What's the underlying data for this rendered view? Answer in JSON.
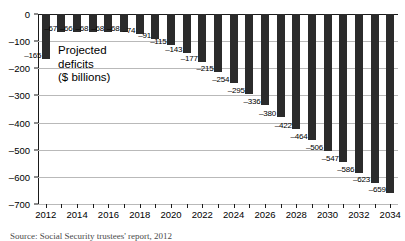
{
  "chart_data": {
    "type": "bar",
    "title": "",
    "xlabel": "",
    "ylabel": "",
    "annotation": [
      "Projected",
      "deficits",
      "($ billions)"
    ],
    "ylim": [
      -700,
      0
    ],
    "ytick_values": [
      0,
      -100,
      -200,
      -300,
      -400,
      -500,
      -600,
      -700
    ],
    "ytick_labels": [
      "0",
      "–100",
      "–200",
      "–300",
      "–400",
      "–500",
      "–600",
      "–700"
    ],
    "grid": true,
    "legend": "none",
    "categories": [
      2012,
      2013,
      2014,
      2015,
      2016,
      2017,
      2018,
      2019,
      2020,
      2021,
      2022,
      2023,
      2024,
      2025,
      2026,
      2027,
      2028,
      2029,
      2030,
      2031,
      2032,
      2033,
      2034
    ],
    "xtick_labels": [
      "2012",
      "2014",
      "2016",
      "2018",
      "2020",
      "2022",
      "2024",
      "2026",
      "2028",
      "2030",
      "2032",
      "2034"
    ],
    "xtick_label_years": [
      2012,
      2014,
      2016,
      2018,
      2020,
      2022,
      2024,
      2026,
      2028,
      2030,
      2032,
      2034
    ],
    "values": [
      -165,
      -67,
      -66,
      -68,
      -68,
      -68,
      -74,
      -91,
      -115,
      -143,
      -177,
      -215,
      -254,
      -295,
      -336,
      -380,
      -422,
      -464,
      -506,
      -547,
      -586,
      -623,
      -659
    ],
    "value_labels": [
      "–165",
      "–67",
      "–66",
      "–68",
      "–68",
      "–68",
      "–74",
      "–91",
      "–115",
      "–143",
      "–177",
      "–215",
      "–254",
      "–295",
      "–336",
      "–380",
      "–422",
      "–464",
      "–506",
      "–547",
      "–586",
      "–623",
      "–659"
    ],
    "bar_color": "#2b2b2b",
    "grid_color": "#b9b9b9",
    "axis_color": "#1a1a1a"
  },
  "source": "Source: Social Security trustees' report, 2012"
}
